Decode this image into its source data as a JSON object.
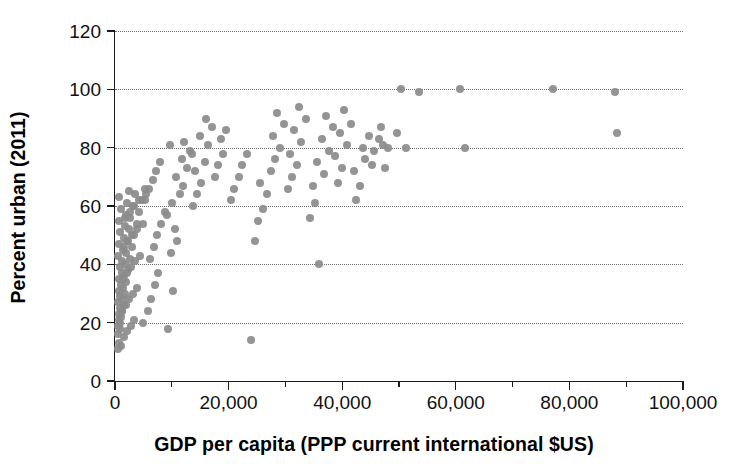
{
  "chart_data": {
    "type": "scatter",
    "title": "",
    "xlabel": "GDP per capita (PPP current international $US)",
    "ylabel": "Percent urban (2011)",
    "xlim": [
      0,
      100000
    ],
    "ylim": [
      0,
      120
    ],
    "xticks": [
      0,
      20000,
      40000,
      60000,
      80000,
      100000
    ],
    "xtick_labels": [
      "0",
      "20,000",
      "40,000",
      "60,000",
      "80,000",
      "100,000"
    ],
    "xminor_ticks": [
      10000,
      30000,
      50000,
      70000,
      90000
    ],
    "yticks": [
      0,
      20,
      40,
      60,
      80,
      100,
      120
    ],
    "ytick_labels": [
      "0",
      "20",
      "40",
      "60",
      "80",
      "100",
      "120"
    ],
    "grid": "horizontal-dotted",
    "legend": "none",
    "marker_color": "#8b8b8b",
    "marker_size_px": 8,
    "points": [
      [
        600,
        11
      ],
      [
        700,
        13
      ],
      [
        450,
        16
      ],
      [
        800,
        18
      ],
      [
        500,
        19
      ],
      [
        900,
        20
      ],
      [
        620,
        21
      ],
      [
        1100,
        22
      ],
      [
        700,
        23
      ],
      [
        1300,
        24
      ],
      [
        850,
        25
      ],
      [
        1500,
        26
      ],
      [
        600,
        27
      ],
      [
        1200,
        28
      ],
      [
        950,
        29
      ],
      [
        1700,
        30
      ],
      [
        780,
        31
      ],
      [
        1400,
        32
      ],
      [
        1000,
        33
      ],
      [
        2000,
        34
      ],
      [
        640,
        35
      ],
      [
        1600,
        36
      ],
      [
        1150,
        37
      ],
      [
        2300,
        38
      ],
      [
        820,
        39
      ],
      [
        1800,
        40
      ],
      [
        1250,
        41
      ],
      [
        2600,
        42
      ],
      [
        560,
        43
      ],
      [
        1950,
        44
      ],
      [
        1350,
        45
      ],
      [
        3000,
        46
      ],
      [
        760,
        47
      ],
      [
        2100,
        48
      ],
      [
        1500,
        49
      ],
      [
        3400,
        50
      ],
      [
        900,
        51
      ],
      [
        2400,
        52
      ],
      [
        1700,
        53
      ],
      [
        3800,
        54
      ],
      [
        680,
        55
      ],
      [
        2700,
        56
      ],
      [
        1900,
        57
      ],
      [
        4200,
        58
      ],
      [
        1050,
        59
      ],
      [
        3100,
        60
      ],
      [
        2200,
        61
      ],
      [
        4700,
        62
      ],
      [
        740,
        63
      ],
      [
        3500,
        64
      ],
      [
        2500,
        65
      ],
      [
        5200,
        66
      ],
      [
        1000,
        12
      ],
      [
        1600,
        15
      ],
      [
        2200,
        17
      ],
      [
        2900,
        19
      ],
      [
        3300,
        21
      ],
      [
        1200,
        24
      ],
      [
        1900,
        26
      ],
      [
        2500,
        28
      ],
      [
        3100,
        30
      ],
      [
        3900,
        32
      ],
      [
        1400,
        35
      ],
      [
        2100,
        37
      ],
      [
        2800,
        39
      ],
      [
        3600,
        41
      ],
      [
        4400,
        43
      ],
      [
        1600,
        46
      ],
      [
        2300,
        48
      ],
      [
        3000,
        50
      ],
      [
        3800,
        52
      ],
      [
        4900,
        54
      ],
      [
        1800,
        56
      ],
      [
        2600,
        58
      ],
      [
        3400,
        60
      ],
      [
        4300,
        62
      ],
      [
        5500,
        64
      ],
      [
        5000,
        20
      ],
      [
        5800,
        24
      ],
      [
        6400,
        28
      ],
      [
        7000,
        33
      ],
      [
        7600,
        37
      ],
      [
        6100,
        42
      ],
      [
        6800,
        46
      ],
      [
        7400,
        50
      ],
      [
        8100,
        54
      ],
      [
        8800,
        58
      ],
      [
        5300,
        62
      ],
      [
        6000,
        66
      ],
      [
        6700,
        69
      ],
      [
        7300,
        72
      ],
      [
        8000,
        75
      ],
      [
        9400,
        18
      ],
      [
        10200,
        31
      ],
      [
        9800,
        44
      ],
      [
        11000,
        48
      ],
      [
        10600,
        52
      ],
      [
        9200,
        57
      ],
      [
        10000,
        61
      ],
      [
        11400,
        64
      ],
      [
        12000,
        67
      ],
      [
        10800,
        70
      ],
      [
        12600,
        73
      ],
      [
        11800,
        76
      ],
      [
        13200,
        79
      ],
      [
        12200,
        82
      ],
      [
        9600,
        81
      ],
      [
        13800,
        60
      ],
      [
        14500,
        64
      ],
      [
        15200,
        68
      ],
      [
        14000,
        72
      ],
      [
        15800,
        75
      ],
      [
        13500,
        78
      ],
      [
        16400,
        81
      ],
      [
        15000,
        84
      ],
      [
        17000,
        87
      ],
      [
        16000,
        90
      ],
      [
        17600,
        70
      ],
      [
        18200,
        74
      ],
      [
        19000,
        78
      ],
      [
        18600,
        83
      ],
      [
        19600,
        86
      ],
      [
        20400,
        62
      ],
      [
        21000,
        66
      ],
      [
        21800,
        70
      ],
      [
        22400,
        74
      ],
      [
        23200,
        78
      ],
      [
        24000,
        14
      ],
      [
        24600,
        48
      ],
      [
        25200,
        55
      ],
      [
        26000,
        59
      ],
      [
        26800,
        64
      ],
      [
        25600,
        68
      ],
      [
        27400,
        72
      ],
      [
        28200,
        76
      ],
      [
        29000,
        80
      ],
      [
        27800,
        84
      ],
      [
        29800,
        88
      ],
      [
        28600,
        92
      ],
      [
        30400,
        66
      ],
      [
        31200,
        70
      ],
      [
        32000,
        74
      ],
      [
        30800,
        78
      ],
      [
        32800,
        82
      ],
      [
        31600,
        86
      ],
      [
        33600,
        90
      ],
      [
        32400,
        94
      ],
      [
        34400,
        56
      ],
      [
        35200,
        61
      ],
      [
        36000,
        40
      ],
      [
        34800,
        67
      ],
      [
        36800,
        71
      ],
      [
        35600,
        75
      ],
      [
        37600,
        79
      ],
      [
        36400,
        83
      ],
      [
        38400,
        87
      ],
      [
        37200,
        91
      ],
      [
        39200,
        68
      ],
      [
        40000,
        73
      ],
      [
        38800,
        77
      ],
      [
        40800,
        81
      ],
      [
        39600,
        85
      ],
      [
        41600,
        88
      ],
      [
        40400,
        93
      ],
      [
        42400,
        62
      ],
      [
        43200,
        67
      ],
      [
        42000,
        72
      ],
      [
        44000,
        76
      ],
      [
        43600,
        80
      ],
      [
        44800,
        84
      ],
      [
        45600,
        79
      ],
      [
        46400,
        83
      ],
      [
        45200,
        74
      ],
      [
        47200,
        81
      ],
      [
        46800,
        87
      ],
      [
        48000,
        80
      ],
      [
        47600,
        73
      ],
      [
        50400,
        100
      ],
      [
        51200,
        80
      ],
      [
        49600,
        85
      ],
      [
        53600,
        99
      ],
      [
        60800,
        100
      ],
      [
        61600,
        80
      ],
      [
        77200,
        100
      ],
      [
        88000,
        99
      ],
      [
        88400,
        85
      ]
    ]
  }
}
